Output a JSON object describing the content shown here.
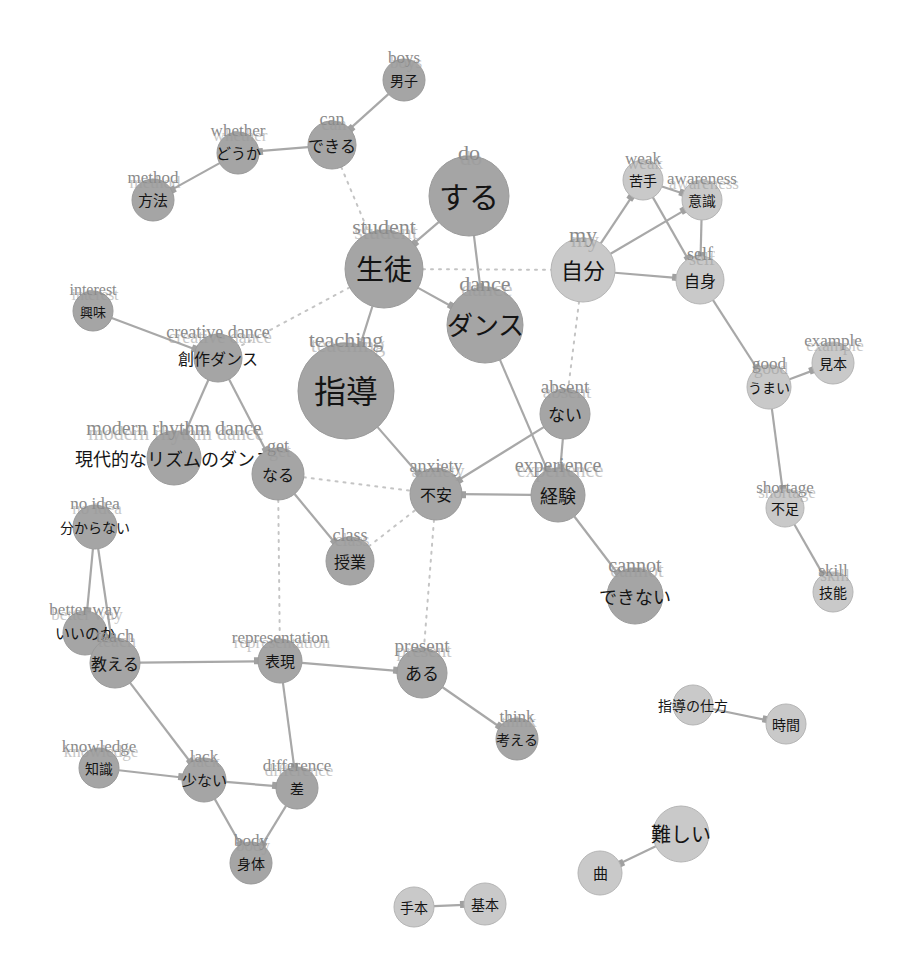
{
  "diagram": {
    "type": "co-occurrence-network",
    "colors": {
      "node_dark": "#a5a5a5",
      "node_light": "#c9c9c9",
      "edge": "#a8a8a8",
      "edge_dotted": "#c4c4c4",
      "label_en": "#8a8a8a",
      "label_jp": "#141414"
    },
    "nodes": [
      {
        "id": "boys",
        "jp": "男子",
        "en": "boys",
        "x": 404,
        "y": 80,
        "r": 21,
        "tone": "dark",
        "fs": 14
      },
      {
        "id": "can",
        "jp": "できる",
        "en": "can",
        "x": 332,
        "y": 145,
        "r": 24,
        "tone": "dark",
        "fs": 16
      },
      {
        "id": "whether",
        "jp": "どうか",
        "en": "whether",
        "x": 238,
        "y": 153,
        "r": 21,
        "tone": "dark",
        "fs": 15
      },
      {
        "id": "method",
        "jp": "方法",
        "en": "method",
        "x": 153,
        "y": 200,
        "r": 21,
        "tone": "dark",
        "fs": 15
      },
      {
        "id": "do",
        "jp": "する",
        "en": "do",
        "x": 469,
        "y": 196,
        "r": 40,
        "tone": "dark",
        "fs": 30
      },
      {
        "id": "student",
        "jp": "生徒",
        "en": "student",
        "x": 384,
        "y": 269,
        "r": 39,
        "tone": "dark",
        "fs": 28
      },
      {
        "id": "dance",
        "jp": "ダンス",
        "en": "dance",
        "x": 485,
        "y": 325,
        "r": 38,
        "tone": "dark",
        "fs": 26
      },
      {
        "id": "teaching",
        "jp": "指導",
        "en": "teaching",
        "x": 346,
        "y": 391,
        "r": 48,
        "tone": "dark",
        "fs": 32
      },
      {
        "id": "my",
        "jp": "自分",
        "en": "my",
        "x": 583,
        "y": 270,
        "r": 32,
        "tone": "light",
        "fs": 22
      },
      {
        "id": "weak",
        "jp": "苦手",
        "en": "weak",
        "x": 643,
        "y": 180,
        "r": 20,
        "tone": "light",
        "fs": 14
      },
      {
        "id": "awareness",
        "jp": "意識",
        "en": "awareness",
        "x": 702,
        "y": 200,
        "r": 20,
        "tone": "light",
        "fs": 14
      },
      {
        "id": "self",
        "jp": "自身",
        "en": "self",
        "x": 700,
        "y": 280,
        "r": 24,
        "tone": "light",
        "fs": 16
      },
      {
        "id": "example",
        "jp": "見本",
        "en": "example",
        "x": 833,
        "y": 363,
        "r": 21,
        "tone": "light",
        "fs": 14
      },
      {
        "id": "good",
        "jp": "うまい",
        "en": "good",
        "x": 769,
        "y": 387,
        "r": 22,
        "tone": "light",
        "fs": 14
      },
      {
        "id": "shortage",
        "jp": "不足",
        "en": "shortage",
        "x": 785,
        "y": 508,
        "r": 19,
        "tone": "light",
        "fs": 14
      },
      {
        "id": "skill",
        "jp": "技能",
        "en": "skill",
        "x": 833,
        "y": 592,
        "r": 20,
        "tone": "light",
        "fs": 14
      },
      {
        "id": "interest",
        "jp": "興味",
        "en": "interest",
        "x": 93,
        "y": 311,
        "r": 20,
        "tone": "dark",
        "fs": 13
      },
      {
        "id": "creative_dance",
        "jp": "創作ダンス",
        "en": "creative dance",
        "x": 218,
        "y": 358,
        "r": 24,
        "tone": "dark",
        "fs": 16
      },
      {
        "id": "modern_rhythm_dance",
        "jp": "現代的なリズムのダンス",
        "en": "modern rhythm dance",
        "x": 174,
        "y": 458,
        "r": 27,
        "tone": "dark",
        "fs": 18
      },
      {
        "id": "absent",
        "jp": "ない",
        "en": "absent",
        "x": 565,
        "y": 414,
        "r": 25,
        "tone": "dark",
        "fs": 17
      },
      {
        "id": "experience",
        "jp": "経験",
        "en": "experience",
        "x": 558,
        "y": 495,
        "r": 27,
        "tone": "dark",
        "fs": 18
      },
      {
        "id": "anxiety",
        "jp": "不安",
        "en": "anxiety",
        "x": 436,
        "y": 494,
        "r": 26,
        "tone": "dark",
        "fs": 16
      },
      {
        "id": "get",
        "jp": "なる",
        "en": "get",
        "x": 278,
        "y": 474,
        "r": 26,
        "tone": "dark",
        "fs": 16
      },
      {
        "id": "class",
        "jp": "授業",
        "en": "class",
        "x": 350,
        "y": 561,
        "r": 24,
        "tone": "dark",
        "fs": 16
      },
      {
        "id": "cannot",
        "jp": "できない",
        "en": "cannot",
        "x": 635,
        "y": 596,
        "r": 28,
        "tone": "dark",
        "fs": 18
      },
      {
        "id": "no_idea",
        "jp": "分からない",
        "en": "no idea",
        "x": 95,
        "y": 527,
        "r": 22,
        "tone": "dark",
        "fs": 14
      },
      {
        "id": "better_way",
        "jp": "いいのか",
        "en": "better way",
        "x": 85,
        "y": 633,
        "r": 22,
        "tone": "dark",
        "fs": 15
      },
      {
        "id": "teach",
        "jp": "教える",
        "en": "teach",
        "x": 115,
        "y": 663,
        "r": 25,
        "tone": "dark",
        "fs": 16
      },
      {
        "id": "representation",
        "jp": "表現",
        "en": "representation",
        "x": 280,
        "y": 661,
        "r": 22,
        "tone": "dark",
        "fs": 15
      },
      {
        "id": "present",
        "jp": "ある",
        "en": "present",
        "x": 422,
        "y": 673,
        "r": 25,
        "tone": "dark",
        "fs": 17
      },
      {
        "id": "think",
        "jp": "考える",
        "en": "think",
        "x": 517,
        "y": 739,
        "r": 21,
        "tone": "dark",
        "fs": 14
      },
      {
        "id": "knowledge",
        "jp": "知識",
        "en": "knowledge",
        "x": 99,
        "y": 768,
        "r": 20,
        "tone": "dark",
        "fs": 14
      },
      {
        "id": "lack",
        "jp": "少ない",
        "en": "lack",
        "x": 204,
        "y": 780,
        "r": 22,
        "tone": "dark",
        "fs": 15
      },
      {
        "id": "difference",
        "jp": "差",
        "en": "difference",
        "x": 297,
        "y": 788,
        "r": 21,
        "tone": "dark",
        "fs": 14
      },
      {
        "id": "body",
        "jp": "身体",
        "en": "body",
        "x": 251,
        "y": 863,
        "r": 21,
        "tone": "dark",
        "fs": 14
      },
      {
        "id": "teaching_method",
        "jp": "指導の仕方",
        "en": "",
        "x": 693,
        "y": 705,
        "r": 20,
        "tone": "light",
        "fs": 14
      },
      {
        "id": "time",
        "jp": "時間",
        "en": "",
        "x": 786,
        "y": 724,
        "r": 20,
        "tone": "light",
        "fs": 14
      },
      {
        "id": "difficult",
        "jp": "難しい",
        "en": "",
        "x": 681,
        "y": 834,
        "r": 28,
        "tone": "light",
        "fs": 20
      },
      {
        "id": "song",
        "jp": "曲",
        "en": "",
        "x": 600,
        "y": 873,
        "r": 22,
        "tone": "light",
        "fs": 15
      },
      {
        "id": "model",
        "jp": "手本",
        "en": "",
        "x": 414,
        "y": 907,
        "r": 20,
        "tone": "light",
        "fs": 14
      },
      {
        "id": "basic",
        "jp": "基本",
        "en": "",
        "x": 485,
        "y": 904,
        "r": 21,
        "tone": "light",
        "fs": 14
      }
    ],
    "edges": [
      {
        "from": "boys",
        "to": "can",
        "style": "solid"
      },
      {
        "from": "can",
        "to": "whether",
        "style": "solid"
      },
      {
        "from": "whether",
        "to": "method",
        "style": "solid"
      },
      {
        "from": "can",
        "to": "student",
        "style": "dotted"
      },
      {
        "from": "do",
        "to": "student",
        "style": "solid"
      },
      {
        "from": "do",
        "to": "dance",
        "style": "solid"
      },
      {
        "from": "student",
        "to": "dance",
        "style": "solid"
      },
      {
        "from": "student",
        "to": "teaching",
        "style": "solid"
      },
      {
        "from": "student",
        "to": "my",
        "style": "dotted"
      },
      {
        "from": "student",
        "to": "creative_dance",
        "style": "dotted"
      },
      {
        "from": "my",
        "to": "weak",
        "style": "solid"
      },
      {
        "from": "my",
        "to": "awareness",
        "style": "solid"
      },
      {
        "from": "my",
        "to": "self",
        "style": "solid"
      },
      {
        "from": "weak",
        "to": "awareness",
        "style": "solid"
      },
      {
        "from": "weak",
        "to": "self",
        "style": "solid"
      },
      {
        "from": "awareness",
        "to": "self",
        "style": "solid"
      },
      {
        "from": "self",
        "to": "good",
        "style": "solid"
      },
      {
        "from": "good",
        "to": "example",
        "style": "solid"
      },
      {
        "from": "good",
        "to": "shortage",
        "style": "solid"
      },
      {
        "from": "shortage",
        "to": "skill",
        "style": "solid"
      },
      {
        "from": "my",
        "to": "absent",
        "style": "dotted"
      },
      {
        "from": "interest",
        "to": "creative_dance",
        "style": "solid"
      },
      {
        "from": "creative_dance",
        "to": "modern_rhythm_dance",
        "style": "solid"
      },
      {
        "from": "creative_dance",
        "to": "get",
        "style": "solid"
      },
      {
        "from": "dance",
        "to": "experience",
        "style": "solid"
      },
      {
        "from": "absent",
        "to": "anxiety",
        "style": "solid"
      },
      {
        "from": "absent",
        "to": "experience",
        "style": "solid"
      },
      {
        "from": "experience",
        "to": "anxiety",
        "style": "solid"
      },
      {
        "from": "experience",
        "to": "cannot",
        "style": "solid"
      },
      {
        "from": "teaching",
        "to": "anxiety",
        "style": "solid"
      },
      {
        "from": "get",
        "to": "class",
        "style": "solid"
      },
      {
        "from": "get",
        "to": "anxiety",
        "style": "dotted"
      },
      {
        "from": "class",
        "to": "anxiety",
        "style": "dotted"
      },
      {
        "from": "get",
        "to": "representation",
        "style": "dotted"
      },
      {
        "from": "anxiety",
        "to": "present",
        "style": "dotted"
      },
      {
        "from": "no_idea",
        "to": "better_way",
        "style": "solid"
      },
      {
        "from": "no_idea",
        "to": "teach",
        "style": "solid"
      },
      {
        "from": "better_way",
        "to": "teach",
        "style": "solid"
      },
      {
        "from": "teach",
        "to": "representation",
        "style": "solid"
      },
      {
        "from": "teach",
        "to": "lack",
        "style": "solid"
      },
      {
        "from": "representation",
        "to": "present",
        "style": "solid"
      },
      {
        "from": "representation",
        "to": "difference",
        "style": "solid"
      },
      {
        "from": "present",
        "to": "think",
        "style": "solid"
      },
      {
        "from": "knowledge",
        "to": "lack",
        "style": "solid"
      },
      {
        "from": "lack",
        "to": "difference",
        "style": "solid"
      },
      {
        "from": "lack",
        "to": "body",
        "style": "solid"
      },
      {
        "from": "difference",
        "to": "body",
        "style": "solid"
      },
      {
        "from": "teaching_method",
        "to": "time",
        "style": "solid"
      },
      {
        "from": "difficult",
        "to": "song",
        "style": "solid"
      },
      {
        "from": "model",
        "to": "basic",
        "style": "solid"
      }
    ]
  }
}
